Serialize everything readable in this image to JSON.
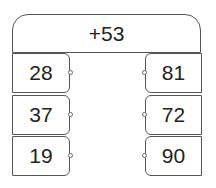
{
  "operation": "+53",
  "inputs": [
    "28",
    "37",
    "19"
  ],
  "outputs": [
    "81",
    "72",
    "90"
  ]
}
